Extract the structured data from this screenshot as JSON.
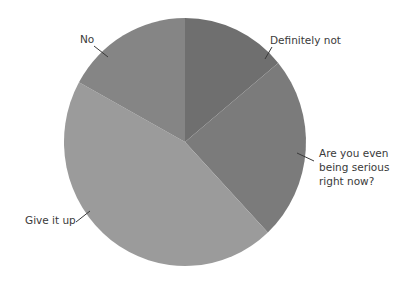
{
  "chart_data": {
    "type": "pie",
    "title": "",
    "start_angle_deg": 0,
    "direction": "clockwise",
    "slices": [
      {
        "label": "Definitely not",
        "value": 14,
        "color": "#6f6f6f"
      },
      {
        "label": "Are you even being serious right now?",
        "value": 24,
        "color": "#7b7b7b"
      },
      {
        "label": "Give it up",
        "value": 45,
        "color": "#9b9b9b"
      },
      {
        "label": "No",
        "value": 17,
        "color": "#858585"
      }
    ],
    "legend": "none",
    "labels_position": "outside_with_leader_lines"
  },
  "labels": {
    "definitely_not": "Definitely not",
    "serious": [
      "Are you even",
      "being serious",
      "right now?"
    ],
    "give_it_up": "Give it up",
    "no": "No"
  },
  "colors": {
    "background": "#ffffff",
    "label_text": "#3a3a3a",
    "leader_line": "#3a3a3a"
  }
}
